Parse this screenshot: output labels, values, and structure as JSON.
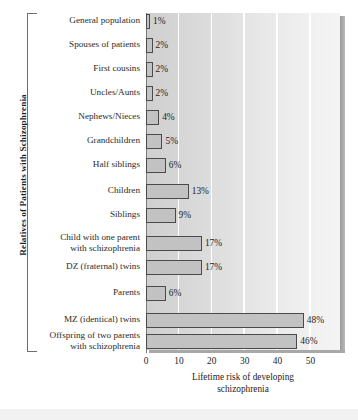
{
  "chart_data": {
    "type": "bar",
    "orientation": "horizontal",
    "title": "",
    "xlabel": "Lifetime risk of developing\nschizophrenia",
    "ylabel": "Relatives of Patients with Schizophrenia",
    "xlim": [
      0,
      59
    ],
    "xticks": [
      0,
      10,
      20,
      30,
      40,
      50
    ],
    "xtick_labels": [
      "0",
      "10",
      "20",
      "30",
      "40",
      "50"
    ],
    "grid": true,
    "grid_orientation": "vertical",
    "legend": "none",
    "value_suffix": "%",
    "bar_color": "#c2c2c2",
    "bar_edge_color": "#4a4a4a",
    "plot_bg_left": "#cfcfcf",
    "plot_bg_right": "#f4f4f4",
    "gridline_color": "#ffffff",
    "categories": [
      "General population",
      "Spouses of patients",
      "First cousins",
      "Uncles/Aunts",
      "Nephews/Nieces",
      "Grandchildren",
      "Half siblings",
      "Children",
      "Siblings",
      "Child with one parent\nwith schizophrenia",
      "DZ (fraternal) twins",
      "Parents",
      "MZ (identical) twins",
      "Offspring of two parents\nwith schizophrenia"
    ],
    "values": [
      1,
      2,
      2,
      2,
      4,
      5,
      6,
      13,
      9,
      17,
      17,
      6,
      48,
      46
    ],
    "value_labels": [
      "1%",
      "2%",
      "2%",
      "2%",
      "4%",
      "5%",
      "6%",
      "13%",
      "9%",
      "17%",
      "17%",
      "6%",
      "48%",
      "46%"
    ]
  }
}
